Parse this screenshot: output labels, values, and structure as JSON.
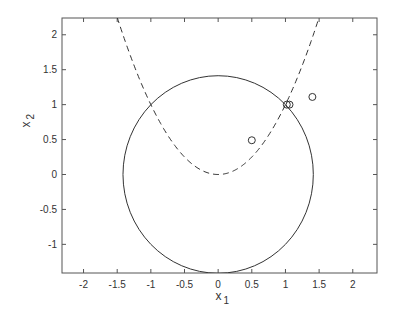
{
  "chart_data": {
    "type": "line",
    "title": "",
    "xlabel": "x_1",
    "ylabel": "x_2",
    "xlim": [
      -2.32,
      2.36
    ],
    "ylim": [
      -1.41,
      2.24
    ],
    "grid": false,
    "xticks": [
      -2,
      -1.5,
      -1,
      -0.5,
      0,
      0.5,
      1,
      1.5,
      2
    ],
    "xtick_labels": [
      "-2",
      "-1.5",
      "-1",
      "-0.5",
      "0",
      "0.5",
      "1",
      "1.5",
      "2"
    ],
    "yticks": [
      -1,
      -0.5,
      0,
      0.5,
      1,
      1.5,
      2
    ],
    "ytick_labels": [
      "-1",
      "-0.5",
      "0",
      "0.5",
      "1",
      "1.5",
      "2"
    ],
    "series": [
      {
        "name": "circle",
        "style": "solid",
        "shape": "circle",
        "center": [
          0,
          0
        ],
        "radius": 1.414
      },
      {
        "name": "parabola",
        "style": "dashed",
        "equation": "x2 = x1^2",
        "x_range": [
          -1.5,
          1.5
        ]
      },
      {
        "name": "points",
        "style": "markers",
        "marker": "open-circle",
        "x": [
          0.5,
          1.02,
          1.06,
          1.4
        ],
        "y": [
          0.49,
          1.0,
          1.0,
          1.11
        ]
      }
    ]
  },
  "axes": {
    "xlabel_main": "x",
    "xlabel_sub": "1",
    "ylabel_main": "x",
    "ylabel_sub": "2"
  }
}
